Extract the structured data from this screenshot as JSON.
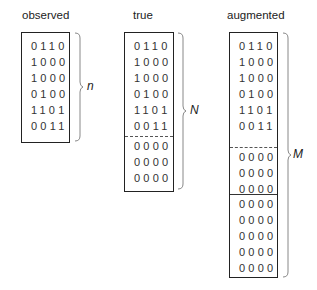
{
  "panels": [
    {
      "title": "observed",
      "label": "n",
      "rows": [
        "0110",
        "1000",
        "1000",
        "0100",
        "1101",
        "0011"
      ]
    },
    {
      "title": "true",
      "label": "N",
      "rows": [
        "0110",
        "1000",
        "1000",
        "0100",
        "1101",
        "0011",
        "0000",
        "0000",
        "0000"
      ]
    },
    {
      "title": "augmented",
      "label": "M",
      "rows": [
        "0110",
        "1000",
        "1000",
        "0100",
        "1101",
        "0011",
        "0000",
        "0000",
        "0000",
        "0000",
        "0000",
        "0000",
        "0000",
        "0000"
      ]
    }
  ],
  "colors": {
    "line": "#222222",
    "text": "#333333",
    "brace": "#888888"
  }
}
